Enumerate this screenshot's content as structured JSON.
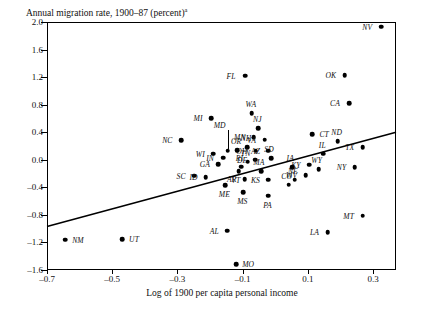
{
  "chart_data": {
    "type": "scatter",
    "title": "Annual migration rate, 1900–87 (percent)",
    "title_superscript": "a",
    "xlabel": "Log of 1900 per capita personal income",
    "ylabel": "",
    "xlim": [
      -0.7,
      0.37
    ],
    "ylim": [
      -1.6,
      2.0
    ],
    "xticks": [
      "–0.7",
      "–0.5",
      "–0.3",
      "–0.1",
      "0.1",
      "0.3"
    ],
    "xtick_values": [
      -0.7,
      -0.5,
      -0.3,
      -0.1,
      0.1,
      0.3
    ],
    "yticks": [
      "2.0",
      "1.6",
      "1.2",
      "0.8",
      "0.4",
      "0.0",
      "–0.4",
      "–0.8",
      "–1.2",
      "–1.6"
    ],
    "ytick_values": [
      2.0,
      1.6,
      1.2,
      0.8,
      0.4,
      0.0,
      -0.4,
      -0.8,
      -1.2,
      -1.6
    ],
    "grid": false,
    "legend": false,
    "regression_line": {
      "x0": -0.7,
      "y0": -0.97,
      "x1": 0.37,
      "y1": 0.4
    },
    "points": [
      {
        "label": "NV",
        "x": 0.325,
        "y": 1.93,
        "lx": -14,
        "ly": 0
      },
      {
        "label": "FL",
        "x": -0.093,
        "y": 1.22,
        "lx": -14,
        "ly": 0
      },
      {
        "label": "OK",
        "x": 0.213,
        "y": 1.23,
        "lx": -14,
        "ly": 0
      },
      {
        "label": "CA",
        "x": 0.226,
        "y": 0.82,
        "lx": -14,
        "ly": 0
      },
      {
        "label": "WA",
        "x": -0.072,
        "y": 0.68,
        "lx": -1,
        "ly": -9
      },
      {
        "label": "MI",
        "x": -0.197,
        "y": 0.6,
        "lx": -13,
        "ly": 0
      },
      {
        "label": "NJ",
        "x": -0.052,
        "y": 0.46,
        "lx": -1,
        "ly": -9
      },
      {
        "label": "CT",
        "x": 0.113,
        "y": 0.37,
        "lx": 12,
        "ly": 0
      },
      {
        "label": "ND",
        "x": 0.191,
        "y": 0.27,
        "lx": -1,
        "ly": -9
      },
      {
        "label": "MN",
        "x": -0.066,
        "y": 0.33,
        "lx": -14,
        "ly": 0
      },
      {
        "label": "VA",
        "x": -0.033,
        "y": 0.29,
        "lx": -13,
        "ly": 0
      },
      {
        "label": "NC",
        "x": -0.288,
        "y": 0.28,
        "lx": -14,
        "ly": 0
      },
      {
        "label": "MD",
        "x": -0.146,
        "y": 0.13,
        "lx": -8,
        "ly": -26,
        "leader": true
      },
      {
        "label": "NH",
        "x": -0.087,
        "y": 0.18,
        "lx": -1,
        "ly": -9
      },
      {
        "label": "OH",
        "x": -0.06,
        "y": 0.13,
        "lx": -14,
        "ly": 0
      },
      {
        "label": "AZ",
        "x": -0.021,
        "y": 0.13,
        "lx": -13,
        "ly": 0
      },
      {
        "label": "OR",
        "x": -0.117,
        "y": 0.14,
        "lx": -1,
        "ly": -9
      },
      {
        "label": "IL",
        "x": 0.147,
        "y": 0.09,
        "lx": -1,
        "ly": -9
      },
      {
        "label": "WI",
        "x": -0.19,
        "y": 0.09,
        "lx": -13,
        "ly": 0
      },
      {
        "label": "IN",
        "x": -0.16,
        "y": 0.03,
        "lx": -13,
        "ly": 0
      },
      {
        "label": "DE",
        "x": -0.062,
        "y": 0.0,
        "lx": -13,
        "ly": 0
      },
      {
        "label": "SD",
        "x": -0.013,
        "y": 0.02,
        "lx": -2,
        "ly": -9
      },
      {
        "label": "GA",
        "x": -0.176,
        "y": -0.06,
        "lx": -13,
        "ly": 0
      },
      {
        "label": "TN",
        "x": -0.085,
        "y": -0.03,
        "lx": -2,
        "ly": -9
      },
      {
        "label": "RI",
        "x": -0.104,
        "y": -0.1,
        "lx": -2,
        "ly": -9
      },
      {
        "label": "KY",
        "x": 0.103,
        "y": -0.07,
        "lx": -13,
        "ly": 0
      },
      {
        "label": "IA",
        "x": 0.052,
        "y": -0.11,
        "lx": -2,
        "ly": -9
      },
      {
        "label": "NY",
        "x": 0.243,
        "y": -0.11,
        "lx": -13,
        "ly": 0
      },
      {
        "label": "TX",
        "x": 0.268,
        "y": 0.18,
        "lx": -13,
        "ly": 0
      },
      {
        "label": "MA",
        "x": -0.044,
        "y": -0.17,
        "lx": -2,
        "ly": -9
      },
      {
        "label": "WV",
        "x": 0.093,
        "y": -0.22,
        "lx": -14,
        "ly": 0
      },
      {
        "label": "WY",
        "x": 0.133,
        "y": -0.14,
        "lx": -2,
        "ly": -9
      },
      {
        "label": "NE",
        "x": 0.06,
        "y": -0.29,
        "lx": -2,
        "ly": -9
      },
      {
        "label": "SC",
        "x": -0.249,
        "y": -0.23,
        "lx": -13,
        "ly": 0
      },
      {
        "label": "ID",
        "x": -0.214,
        "y": -0.25,
        "lx": -12,
        "ly": 0
      },
      {
        "label": "VT",
        "x": -0.112,
        "y": -0.17,
        "lx": -3,
        "ly": 9
      },
      {
        "label": "AR",
        "x": -0.094,
        "y": -0.28,
        "lx": -13,
        "ly": 0
      },
      {
        "label": "KS",
        "x": -0.021,
        "y": -0.29,
        "lx": -13,
        "ly": 0
      },
      {
        "label": "CO",
        "x": 0.041,
        "y": -0.36,
        "lx": -2,
        "ly": -9
      },
      {
        "label": "ME",
        "x": -0.153,
        "y": -0.37,
        "lx": -1,
        "ly": 9
      },
      {
        "label": "MS",
        "x": -0.098,
        "y": -0.47,
        "lx": -1,
        "ly": 9
      },
      {
        "label": "PA",
        "x": -0.021,
        "y": -0.52,
        "lx": -1,
        "ly": 9
      },
      {
        "label": "MT",
        "x": 0.268,
        "y": -0.81,
        "lx": -14,
        "ly": 0
      },
      {
        "label": "AL",
        "x": -0.147,
        "y": -1.03,
        "lx": -13,
        "ly": 0
      },
      {
        "label": "LA",
        "x": 0.16,
        "y": -1.05,
        "lx": -13,
        "ly": 0
      },
      {
        "label": "NM",
        "x": -0.645,
        "y": -1.16,
        "lx": 13,
        "ly": 0
      },
      {
        "label": "UT",
        "x": -0.47,
        "y": -1.15,
        "lx": 12,
        "ly": 0
      },
      {
        "label": "MO",
        "x": -0.12,
        "y": -1.52,
        "lx": 12,
        "ly": 0
      }
    ]
  }
}
